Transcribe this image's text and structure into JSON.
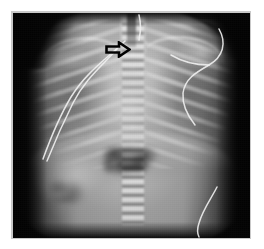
{
  "figure": {
    "modality": "radiograph",
    "view": "AP chest and abdomen",
    "subject": "infant",
    "caption": "",
    "mount": {
      "page_background": "#ffffff",
      "mount_border_color": "#c9c9c9",
      "film_background": "#050505"
    }
  },
  "annotations": [
    {
      "id": "arrow-1",
      "type": "arrow",
      "label": "",
      "direction": "right",
      "style": "hollow-outline",
      "color": "#000000",
      "points_at": "upper mediastinum / paratracheal region",
      "x": 92,
      "y": 28,
      "width": 26,
      "height": 17
    }
  ],
  "anatomy": {
    "regions": [
      {
        "name": "thorax",
        "label": "Thorax"
      },
      {
        "name": "lung-left",
        "label": "Left lung field"
      },
      {
        "name": "lung-right",
        "label": "Right lung field"
      },
      {
        "name": "spine",
        "label": "Vertebral column"
      },
      {
        "name": "cardiothymic-silhouette",
        "label": "Cardiothymic silhouette"
      },
      {
        "name": "diaphragm",
        "label": "Diaphragm"
      },
      {
        "name": "liver",
        "label": "Liver shadow"
      },
      {
        "name": "abdomen",
        "label": "Abdominal bowel gas"
      },
      {
        "name": "ribs",
        "label": "Rib cage"
      },
      {
        "name": "clavicles",
        "label": "Clavicles"
      }
    ]
  },
  "devices": [
    {
      "name": "lead-wire-left",
      "label": "Monitoring lead wire, left"
    },
    {
      "name": "lead-wire-right",
      "label": "Monitoring lead wire, right"
    },
    {
      "name": "lead-wire-lower-right",
      "label": "Monitoring lead wire, lower right"
    },
    {
      "name": "midline-tube",
      "label": "Midline tube, upper thorax"
    }
  ],
  "accessibility": {
    "alt_text": "Frontal radiograph of an infant chest and abdomen with a black outlined arrow pointing to the right at the upper mediastinum; monitoring lead wires cross the field."
  }
}
